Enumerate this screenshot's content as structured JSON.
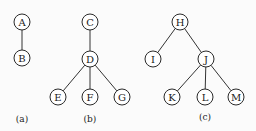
{
  "diagram": {
    "type": "trees",
    "node_radius": 8,
    "colors": {
      "stroke": "#2a2a2a",
      "fill": "#ffffff",
      "background": "#fbfbfb"
    },
    "subfigures": [
      {
        "caption": "(a)",
        "caption_pos": [
          22,
          122
        ],
        "nodes": [
          {
            "id": "A",
            "label": "A",
            "x": 22,
            "y": 22
          },
          {
            "id": "B",
            "label": "B",
            "x": 22,
            "y": 58
          }
        ],
        "edges": [
          [
            "A",
            "B"
          ]
        ]
      },
      {
        "caption": "(b)",
        "caption_pos": [
          90,
          122
        ],
        "nodes": [
          {
            "id": "C",
            "label": "C",
            "x": 90,
            "y": 22
          },
          {
            "id": "D",
            "label": "D",
            "x": 90,
            "y": 59
          },
          {
            "id": "E",
            "label": "E",
            "x": 58,
            "y": 97
          },
          {
            "id": "F",
            "label": "F",
            "x": 90,
            "y": 97
          },
          {
            "id": "G",
            "label": "G",
            "x": 122,
            "y": 97
          }
        ],
        "edges": [
          [
            "C",
            "D"
          ],
          [
            "D",
            "E"
          ],
          [
            "D",
            "F"
          ],
          [
            "D",
            "G"
          ]
        ]
      },
      {
        "caption": "(c)",
        "caption_pos": [
          205,
          120
        ],
        "nodes": [
          {
            "id": "H",
            "label": "H",
            "x": 180,
            "y": 22
          },
          {
            "id": "I",
            "label": "I",
            "x": 153,
            "y": 59
          },
          {
            "id": "J",
            "label": "J",
            "x": 206,
            "y": 59
          },
          {
            "id": "K",
            "label": "K",
            "x": 172,
            "y": 97
          },
          {
            "id": "L",
            "label": "L",
            "x": 205,
            "y": 97
          },
          {
            "id": "M",
            "label": "M",
            "x": 236,
            "y": 97
          }
        ],
        "edges": [
          [
            "H",
            "I"
          ],
          [
            "H",
            "J"
          ],
          [
            "J",
            "K"
          ],
          [
            "J",
            "L"
          ],
          [
            "J",
            "M"
          ]
        ]
      }
    ]
  }
}
